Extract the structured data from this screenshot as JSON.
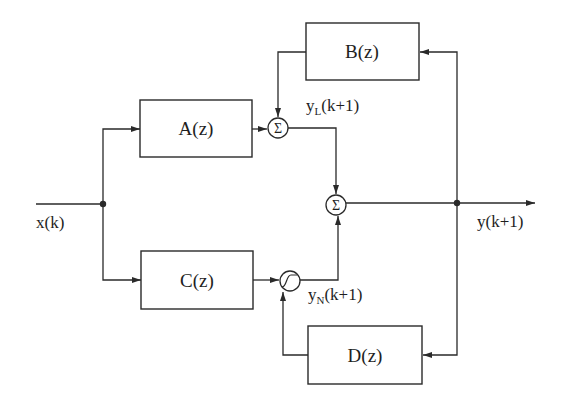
{
  "diagram": {
    "type": "block-diagram",
    "blocks": {
      "a": {
        "label": "A(z)"
      },
      "b": {
        "label": "B(z)"
      },
      "c": {
        "label": "C(z)"
      },
      "d": {
        "label": "D(z)"
      }
    },
    "junctions": {
      "sum_linear": {
        "symbol": "Σ"
      },
      "sum_output": {
        "symbol": "Σ"
      },
      "nonlinearity": {
        "symbol": "sigmoid"
      }
    },
    "signals": {
      "input": {
        "label": "x(k)"
      },
      "output": {
        "label": "y(k+1)"
      },
      "linear_out": {
        "base": "y",
        "subscript": "L",
        "arg": "(k+1)"
      },
      "nonlinear_out": {
        "base": "y",
        "subscript": "N",
        "arg": "(k+1)"
      }
    },
    "connections": [
      {
        "from": "x(k)",
        "to": "A(z)"
      },
      {
        "from": "x(k)",
        "to": "C(z)"
      },
      {
        "from": "A(z)",
        "to": "sum_linear"
      },
      {
        "from": "B(z)",
        "to": "sum_linear"
      },
      {
        "from": "C(z)",
        "to": "nonlinearity"
      },
      {
        "from": "D(z)",
        "to": "nonlinearity"
      },
      {
        "from": "sum_linear",
        "to": "sum_output",
        "signal": "y_L(k+1)"
      },
      {
        "from": "nonlinearity",
        "to": "sum_output",
        "signal": "y_N(k+1)"
      },
      {
        "from": "sum_output",
        "to": "y(k+1)"
      },
      {
        "from": "y(k+1)",
        "to": "B(z)",
        "type": "feedback"
      },
      {
        "from": "y(k+1)",
        "to": "D(z)",
        "type": "feedback"
      }
    ]
  }
}
